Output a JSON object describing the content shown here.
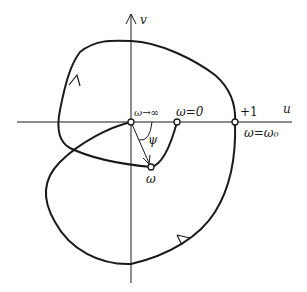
{
  "diagram": {
    "type": "nyquist-plot",
    "axes": {
      "horizontal_label": "u",
      "vertical_label": "v"
    },
    "points": [
      {
        "id": "origin",
        "label": "ω→∞"
      },
      {
        "id": "omega-zero",
        "label": "ω=0"
      },
      {
        "id": "plus-one",
        "label": "+1"
      },
      {
        "id": "omega-zero-sub",
        "label": "ω=ω₀"
      },
      {
        "id": "omega",
        "label": "ω"
      }
    ],
    "angle_label": "ψ",
    "colors": {
      "stroke": "#1a1a1a",
      "background": "#ffffff"
    }
  }
}
